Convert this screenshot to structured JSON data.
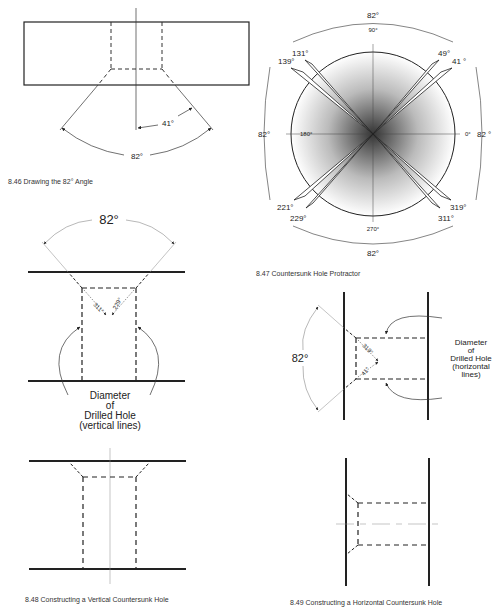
{
  "figures": {
    "fig846": {
      "caption": "8.46  Drawing the 82° Angle",
      "angle_half": "41°",
      "angle_full": "82°"
    },
    "fig847": {
      "caption": "8.47  Countersunk Hole Protractor",
      "ticks": {
        "t90": "90°",
        "t180": "180°",
        "t0": "0°",
        "t270": "270°"
      },
      "arrows": [
        "131°",
        "139°",
        "49°",
        "41 °",
        "221°",
        "229°",
        "319°",
        "311°"
      ],
      "arc_labels": {
        "top": "82°",
        "left": "82°",
        "right": "82 °",
        "bottom": "82°"
      }
    },
    "fig848": {
      "caption": "8.48  Constructing a Vertical Countersunk Hole",
      "angle_full": "82°",
      "label_311": "311°",
      "label_229": "229°",
      "note_lines": [
        "Diameter",
        "of",
        "Drilled Hole",
        "(vertical lines)"
      ]
    },
    "fig849": {
      "caption": "8.49  Constructing a Horizontal Countersunk Hole",
      "angle_full": "82°",
      "label_319": "319°",
      "label_41": "41°",
      "note_lines": [
        "Diameter",
        "of",
        "Drilled Hole",
        "(horizontal",
        "lines)"
      ]
    }
  }
}
